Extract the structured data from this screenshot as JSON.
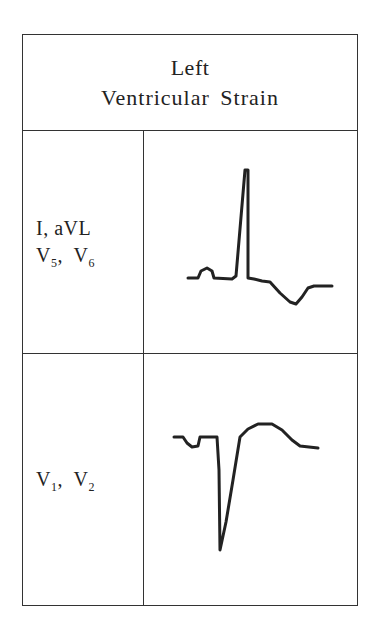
{
  "header": {
    "line1": "Left",
    "line2": "Ventricular Strain"
  },
  "rows": [
    {
      "leads_line1": "I,  aVL",
      "leads_line2_a": "V",
      "leads_line2_a_sub": "5",
      "leads_line2_sep": ",  ",
      "leads_line2_b": "V",
      "leads_line2_b_sub": "6",
      "waveform": "Tall R wave, downsloping ST depression with inverted asymmetric T wave",
      "waveform_points": "188,278 198,278 201,271 207,268 212,271 214,278 232,279 236,276 245,170 248,170 248,278 254,279 262,281 270,282 280,293 290,302 296,304 302,297 308,288 314,286 332,286"
    },
    {
      "leads_line1_a": "V",
      "leads_line1_a_sub": "1",
      "leads_line1_sep": ",  ",
      "leads_line1_b": "V",
      "leads_line1_b_sub": "2",
      "waveform": "Deep S wave with ST elevation and upright T wave",
      "waveform_points": "174,437 183,437 187,443 192,447 198,446 200,437 217,437 219,470 220,550 226,522 233,480 240,437 248,429 258,424 272,424 282,430 292,440 300,446 318,448"
    }
  ],
  "colors": {
    "line": "#222222",
    "border": "#333333",
    "background": "#ffffff"
  }
}
